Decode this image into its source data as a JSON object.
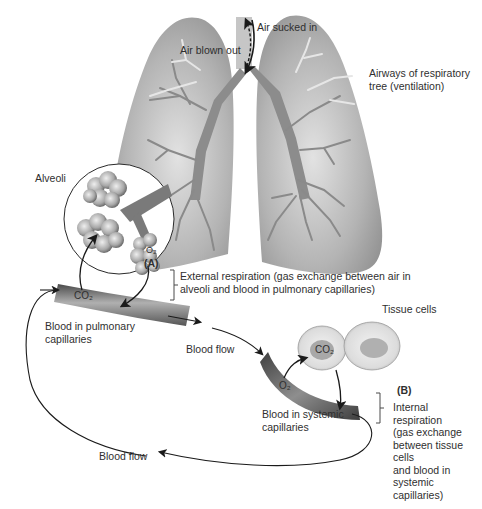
{
  "diagram": {
    "labels": {
      "air_sucked_in": "Air sucked in",
      "air_blown_out": "Air blown out",
      "airways": "Airways of respiratory tree (ventilation)",
      "alveoli": "Alveoli",
      "section_a": "(A)",
      "external_respiration": "External respiration (gas exchange between air in alveoli and blood in pulmonary capillaries)",
      "blood_pulmonary": "Blood in pulmonary capillaries",
      "blood_flow_top": "Blood flow",
      "tissue_cells": "Tissue cells",
      "section_b": "(B)",
      "internal_respiration_lines": [
        "Internal",
        "respiration",
        "(gas exchange",
        "between tissue",
        "cells",
        "and blood in",
        "systemic",
        "capillaries)"
      ],
      "blood_systemic": "Blood in systemic capillaries",
      "blood_flow_bottom": "Blood flow",
      "co2": "CO₂",
      "o2": "O₂"
    },
    "colors": {
      "lung_fill": "#9e9e9e",
      "lung_light": "#d8d8d8",
      "airway": "#8a8a8a",
      "capillary_dark": "#5a5a5a",
      "capillary_mid": "#9a9a9a",
      "cell_fill": "#e4e4e4",
      "cell_nucleus": "#a8a8a8",
      "arrow": "#1a1a1a"
    }
  }
}
